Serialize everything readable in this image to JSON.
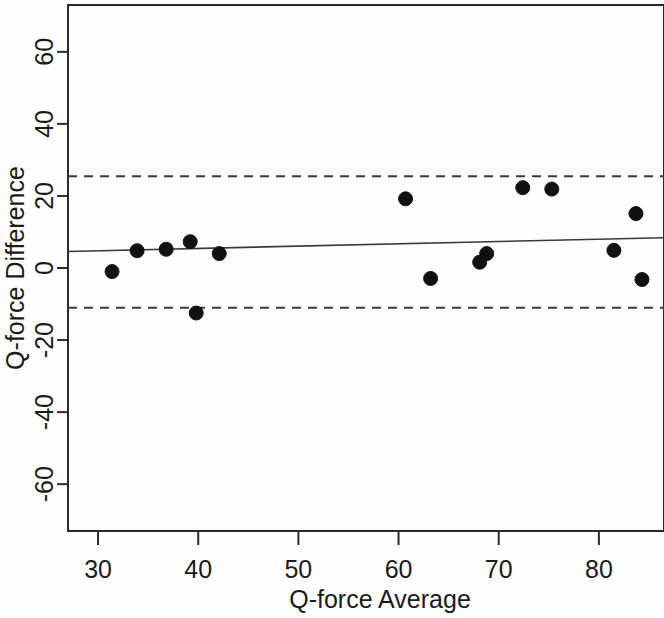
{
  "chart_data": {
    "type": "scatter",
    "title": "",
    "xlabel": "Q-force Average",
    "ylabel": "Q-force Difference",
    "xlim": [
      27.0,
      86.5
    ],
    "ylim": [
      -73.0,
      73.0
    ],
    "xticks": [
      30,
      40,
      50,
      60,
      70,
      80
    ],
    "xtick_labels": [
      "30",
      "40",
      "50",
      "60",
      "70",
      "80"
    ],
    "yticks": [
      -60,
      -40,
      -20,
      0,
      20,
      40,
      60
    ],
    "ytick_labels": [
      "-60",
      "-40",
      "-20",
      "0",
      "20",
      "40",
      "60"
    ],
    "grid": false,
    "legend": null,
    "points": [
      {
        "x": 31.4,
        "y": -1.0
      },
      {
        "x": 33.9,
        "y": 4.8
      },
      {
        "x": 36.8,
        "y": 5.2
      },
      {
        "x": 39.2,
        "y": 7.3
      },
      {
        "x": 39.8,
        "y": -12.5
      },
      {
        "x": 42.1,
        "y": 4.0
      },
      {
        "x": 60.7,
        "y": 19.2
      },
      {
        "x": 63.2,
        "y": -2.9
      },
      {
        "x": 68.1,
        "y": 1.6
      },
      {
        "x": 68.8,
        "y": 4.0
      },
      {
        "x": 72.4,
        "y": 22.3
      },
      {
        "x": 75.3,
        "y": 21.9
      },
      {
        "x": 81.5,
        "y": 4.9
      },
      {
        "x": 83.7,
        "y": 15.1
      },
      {
        "x": 84.3,
        "y": -3.2
      }
    ],
    "reference_lines": [
      {
        "name": "upper-limit-of-agreement",
        "style": "dashed",
        "y": 25.5
      },
      {
        "name": "lower-limit-of-agreement",
        "style": "dashed",
        "y": -11.0
      }
    ],
    "trend_line": {
      "name": "bias-regression-line",
      "style": "solid",
      "x1": 27.0,
      "y1": 4.6,
      "x2": 86.5,
      "y2": 8.4
    },
    "marker_radius_px": 7,
    "colors": {
      "point": "#111111",
      "axis": "#2b2b2b",
      "trend": "#3a3a3a",
      "limit": "#3a3a3a",
      "background": "#fefefe"
    }
  }
}
